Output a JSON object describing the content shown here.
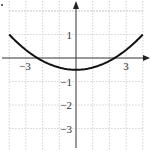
{
  "chart_data": {
    "type": "line",
    "title": "",
    "xlabel": "",
    "ylabel": "",
    "xlim": [
      -4,
      4
    ],
    "ylim": [
      -4,
      2
    ],
    "grid": true,
    "grid_style": "dashed",
    "x_ticks": [
      {
        "value": -3,
        "label": "−3"
      },
      {
        "value": 3,
        "label": "3"
      }
    ],
    "y_ticks": [
      {
        "value": 1,
        "label": "1"
      },
      {
        "value": -1,
        "label": "−1"
      },
      {
        "value": -2,
        "label": "−2"
      },
      {
        "value": -3,
        "label": "−3"
      }
    ],
    "series": [
      {
        "name": "parabola",
        "equation": "y = (3/32)x^2 - 1/2",
        "color": "#111111",
        "x": [
          -4,
          -3,
          -2.31,
          -2,
          -1,
          0,
          1,
          2,
          2.31,
          3,
          4
        ],
        "y": [
          1.0,
          0.34,
          0.0,
          -0.13,
          -0.41,
          -0.5,
          -0.41,
          -0.13,
          0.0,
          0.34,
          1.0
        ]
      }
    ],
    "annotations": {
      "vertex": [
        0,
        -0.5
      ],
      "x_intercepts": [
        -2.31,
        2.31
      ]
    }
  },
  "layout": {
    "origin_px": [
      76,
      58
    ],
    "unit_x_px": 16.7,
    "unit_y_px": 23.5,
    "grid_x_range": [
      -4,
      4
    ],
    "grid_y_range": [
      -4,
      2
    ]
  }
}
